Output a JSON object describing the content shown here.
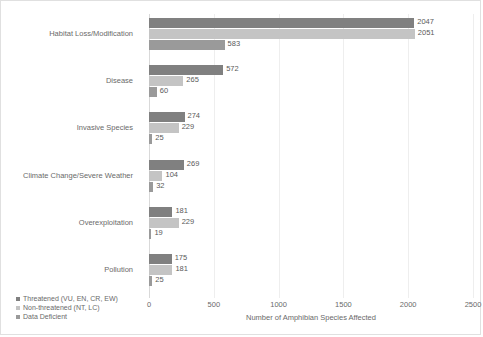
{
  "chart_data": {
    "type": "bar",
    "orientation": "horizontal",
    "title": "",
    "xlabel": "Number of Amphibian Species Affected",
    "ylabel": "",
    "xlim": [
      0,
      2500
    ],
    "xticks": [
      0,
      500,
      1000,
      1500,
      2000,
      2500
    ],
    "xtick_labels": [
      "0",
      "500",
      "1000",
      "1500",
      "2000",
      "2500"
    ],
    "grid": true,
    "grid_axis": "x",
    "legend_position": "bottom-left",
    "categories": [
      "Habitat Loss/Modification",
      "Disease",
      "Invasive Species",
      "Climate Change/Severe Weather",
      "Overexploitation",
      "Pollution"
    ],
    "series": [
      {
        "name": "Threatened (VU, EN, CR, EW)",
        "color": "#808080",
        "values": [
          2047,
          572,
          274,
          269,
          181,
          175
        ],
        "value_labels": [
          "2047",
          "572",
          "274",
          "269",
          "181",
          "175"
        ]
      },
      {
        "name": "Non-threatened (NT, LC)",
        "color": "#c4c4c4",
        "values": [
          2051,
          265,
          229,
          104,
          229,
          181
        ],
        "value_labels": [
          "2051",
          "265",
          "229",
          "104",
          "229",
          "181"
        ]
      },
      {
        "name": "Data Deficient",
        "color": "#9a9a9a",
        "values": [
          583,
          60,
          25,
          32,
          19,
          25
        ],
        "value_labels": [
          "583",
          "60",
          "25",
          "32",
          "19",
          "25"
        ]
      }
    ]
  }
}
